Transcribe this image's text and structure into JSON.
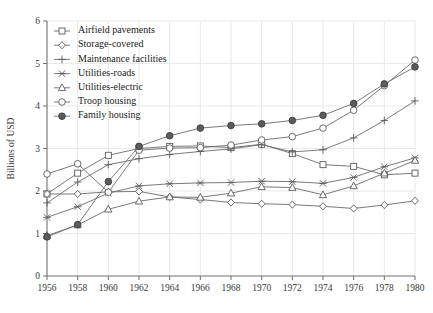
{
  "chart_data": {
    "type": "line",
    "title": "",
    "xlabel": "",
    "ylabel": "Billions of USD",
    "xlim": [
      1956,
      1980
    ],
    "ylim": [
      0,
      6
    ],
    "grid": true,
    "legend_position": "upper-left-inside",
    "x": [
      1956,
      1958,
      1960,
      1962,
      1964,
      1966,
      1968,
      1970,
      1972,
      1974,
      1976,
      1978,
      1980
    ],
    "xticks": [
      "1956",
      "1958",
      "1960",
      "1962",
      "1964",
      "1966",
      "1968",
      "1970",
      "1972",
      "1974",
      "1976",
      "1978",
      "1980"
    ],
    "yticks": [
      "0",
      "1",
      "2",
      "3",
      "4",
      "5",
      "6"
    ],
    "series": [
      {
        "name": "Airfield pavements",
        "marker": "square",
        "values": [
          1.93,
          2.42,
          2.84,
          3.0,
          3.05,
          3.06,
          3.02,
          3.1,
          2.88,
          2.62,
          2.58,
          2.38,
          2.42
        ]
      },
      {
        "name": "Storage-covered",
        "marker": "diamond",
        "values": [
          1.93,
          1.93,
          1.98,
          1.99,
          1.86,
          1.8,
          1.73,
          1.7,
          1.68,
          1.64,
          1.59,
          1.67,
          1.77
        ]
      },
      {
        "name": "Maintenance facilities",
        "marker": "plus",
        "values": [
          1.72,
          2.21,
          2.62,
          2.76,
          2.86,
          2.93,
          2.99,
          3.09,
          2.92,
          2.97,
          3.25,
          3.66,
          4.12
        ]
      },
      {
        "name": "Utilities-roads",
        "marker": "x-star",
        "values": [
          1.38,
          1.63,
          1.95,
          2.12,
          2.17,
          2.19,
          2.2,
          2.23,
          2.22,
          2.18,
          2.32,
          2.57,
          2.78
        ]
      },
      {
        "name": "Utilities-electric",
        "marker": "triangle",
        "values": [
          0.95,
          1.2,
          1.57,
          1.76,
          1.86,
          1.85,
          1.95,
          2.1,
          2.08,
          1.91,
          2.12,
          2.42,
          2.72
        ]
      },
      {
        "name": "Troop housing",
        "marker": "circle",
        "values": [
          2.4,
          2.64,
          1.97,
          2.96,
          3.01,
          3.02,
          3.08,
          3.2,
          3.28,
          3.48,
          3.9,
          4.48,
          5.08
        ]
      },
      {
        "name": "Family housing",
        "marker": "circle-filled",
        "values": [
          0.92,
          1.21,
          2.22,
          3.05,
          3.3,
          3.48,
          3.54,
          3.58,
          3.66,
          3.78,
          4.06,
          4.52,
          4.92
        ]
      }
    ],
    "legend": [
      "Airfield pavements",
      "Storage-covered",
      "Maintenance facilities",
      "Utilities-roads",
      "Utilities-electric",
      "Troop housing",
      "Family housing"
    ],
    "colors": {
      "line": "#6b6b6b",
      "marker_edge": "#5a5a5a",
      "marker_fill": "#ffffff",
      "filled_marker": "#5c5c5c",
      "axis": "#6f6f6f",
      "grid": "#e9e9e9",
      "text": "#222222",
      "background": "#ffffff"
    }
  }
}
